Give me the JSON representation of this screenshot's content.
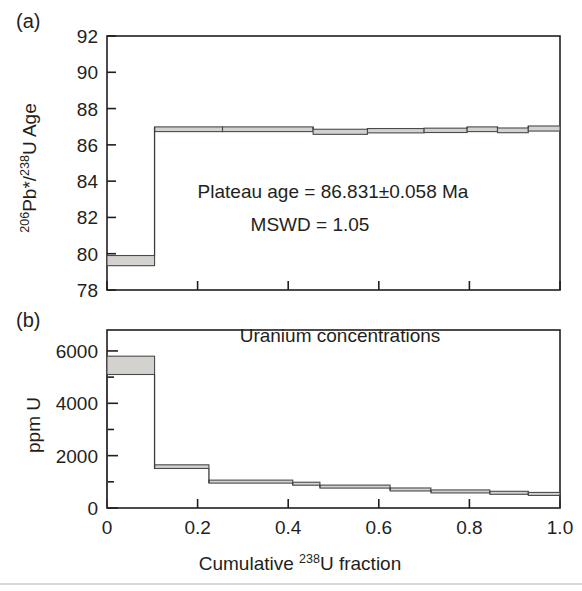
{
  "figure": {
    "panel_a_label": "(a)",
    "panel_b_label": "(b)"
  },
  "panel_a": {
    "y_axis_title_main": "Pb*/",
    "y_axis_title_sup1": "206",
    "y_axis_title_sup2": "238",
    "y_axis_title_tail": "U Age",
    "annotation_line1": "Plateau age = 86.831±0.058 Ma",
    "annotation_line2": "MSWD = 1.05"
  },
  "panel_b": {
    "chart_title": "Uranium concentrations",
    "y_axis_title": "ppm U",
    "x_axis_title_main": "Cumulative ",
    "x_axis_title_sup": "238",
    "x_axis_title_tail": "U fraction"
  },
  "chart_data": [
    {
      "id": "panel_a",
      "type": "bar",
      "title": "",
      "xlabel": "Cumulative 238U fraction",
      "ylabel": "206Pb*/238U Age",
      "xlim": [
        0,
        1.0
      ],
      "ylim": [
        78,
        92
      ],
      "grid": false,
      "legend": "none",
      "xticks": [
        0,
        0.2,
        0.4,
        0.6,
        0.8,
        1.0
      ],
      "xtick_labels": [
        "0",
        "0.2",
        "0.4",
        "0.6",
        "0.8",
        "1.0"
      ],
      "yticks": [
        78,
        80,
        82,
        84,
        86,
        88,
        90,
        92
      ],
      "ytick_labels": [
        "78",
        "80",
        "82",
        "84",
        "86",
        "88",
        "90",
        "92"
      ],
      "units": "Ma",
      "annotations": [
        "Plateau age = 86.831±0.058 Ma",
        "MSWD = 1.05"
      ],
      "steps": [
        {
          "x_start": 0.0,
          "x_end": 0.105,
          "value": 79.62,
          "error": 0.28
        },
        {
          "x_start": 0.105,
          "x_end": 0.255,
          "value": 86.86,
          "error": 0.13
        },
        {
          "x_start": 0.255,
          "x_end": 0.455,
          "value": 86.86,
          "error": 0.13
        },
        {
          "x_start": 0.455,
          "x_end": 0.575,
          "value": 86.72,
          "error": 0.14
        },
        {
          "x_start": 0.575,
          "x_end": 0.7,
          "value": 86.78,
          "error": 0.12
        },
        {
          "x_start": 0.7,
          "x_end": 0.795,
          "value": 86.8,
          "error": 0.12
        },
        {
          "x_start": 0.795,
          "x_end": 0.862,
          "value": 86.86,
          "error": 0.13
        },
        {
          "x_start": 0.862,
          "x_end": 0.93,
          "value": 86.8,
          "error": 0.13
        },
        {
          "x_start": 0.93,
          "x_end": 1.0,
          "value": 86.9,
          "error": 0.14
        }
      ]
    },
    {
      "id": "panel_b",
      "type": "bar",
      "title": "Uranium concentrations",
      "xlabel": "Cumulative 238U fraction",
      "ylabel": "ppm U",
      "xlim": [
        0,
        1.0
      ],
      "ylim": [
        0,
        6800
      ],
      "grid": false,
      "legend": "none",
      "xticks": [
        0,
        0.2,
        0.4,
        0.6,
        0.8,
        1.0
      ],
      "xtick_labels": [
        "0",
        "0.2",
        "0.4",
        "0.6",
        "0.8",
        "1.0"
      ],
      "yticks": [
        0,
        1000,
        2000,
        3000,
        4000,
        5000,
        6000
      ],
      "ytick_labels_major": [
        "0",
        "2000",
        "4000",
        "6000"
      ],
      "units": "ppm",
      "steps": [
        {
          "x_start": 0.0,
          "x_end": 0.105,
          "value": 5450,
          "error": 350
        },
        {
          "x_start": 0.105,
          "x_end": 0.225,
          "value": 1580,
          "error": 70
        },
        {
          "x_start": 0.225,
          "x_end": 0.41,
          "value": 1010,
          "error": 55
        },
        {
          "x_start": 0.41,
          "x_end": 0.47,
          "value": 935,
          "error": 50
        },
        {
          "x_start": 0.47,
          "x_end": 0.625,
          "value": 830,
          "error": 45
        },
        {
          "x_start": 0.625,
          "x_end": 0.715,
          "value": 720,
          "error": 45
        },
        {
          "x_start": 0.715,
          "x_end": 0.845,
          "value": 650,
          "error": 40
        },
        {
          "x_start": 0.845,
          "x_end": 0.93,
          "value": 600,
          "error": 38
        },
        {
          "x_start": 0.93,
          "x_end": 1.0,
          "value": 560,
          "error": 35
        }
      ]
    }
  ]
}
